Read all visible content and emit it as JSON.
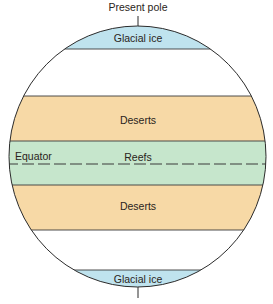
{
  "title": "Present pole",
  "colors": {
    "ice": "#bfe3ee",
    "desert": "#f7d9a6",
    "reef": "#c6e6cc",
    "white_zone": "#ffffff",
    "outline": "#2b2b2b"
  },
  "bands": [
    {
      "id": "glacial-ice-north",
      "label": "Glacial ice",
      "zone": "ice"
    },
    {
      "id": "temperate-north",
      "label": "",
      "zone": "white_zone"
    },
    {
      "id": "deserts-north",
      "label": "Deserts",
      "zone": "desert"
    },
    {
      "id": "reefs",
      "label": "Reefs",
      "zone": "reef"
    },
    {
      "id": "deserts-south",
      "label": "Deserts",
      "zone": "desert"
    },
    {
      "id": "temperate-south",
      "label": "",
      "zone": "white_zone"
    },
    {
      "id": "glacial-ice-south",
      "label": "Glacial ice",
      "zone": "ice"
    }
  ],
  "equator_label": "Equator"
}
